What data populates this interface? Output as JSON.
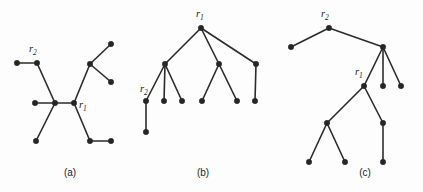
{
  "figure": {
    "background_color": "#fdfdfd",
    "node_color": "#262626",
    "edge_color": "#2b2b2b",
    "node_radius": 2.7,
    "edge_width": 1.6
  },
  "panels": [
    {
      "id": "panel-a",
      "caption": "(a)",
      "caption_pos": {
        "x": 70,
        "y": 176
      },
      "labels": [
        {
          "name": "r2",
          "base": "r",
          "sub": "2",
          "x": 29,
          "y": 52
        },
        {
          "name": "r1",
          "base": "r",
          "sub": "1",
          "x": 79,
          "y": 108
        }
      ],
      "nodes": [
        {
          "name": "a-leaf-left-upper",
          "x": 17,
          "y": 63
        },
        {
          "name": "a-r2",
          "x": 37,
          "y": 63
        },
        {
          "name": "a-leaf-left-mid",
          "x": 35,
          "y": 103
        },
        {
          "name": "a-center",
          "x": 55,
          "y": 103
        },
        {
          "name": "a-leaf-lower-left",
          "x": 36,
          "y": 141
        },
        {
          "name": "a-r1",
          "x": 74,
          "y": 103
        },
        {
          "name": "a-branch-upper",
          "x": 90,
          "y": 64
        },
        {
          "name": "a-leaf-top-right",
          "x": 111,
          "y": 44
        },
        {
          "name": "a-leaf-mid-right",
          "x": 111,
          "y": 82
        },
        {
          "name": "a-leaf-bottom-mid",
          "x": 90,
          "y": 141
        },
        {
          "name": "a-leaf-bottom-right",
          "x": 111,
          "y": 141
        }
      ],
      "edges": [
        {
          "from": "a-leaf-left-upper",
          "to": "a-r2"
        },
        {
          "from": "a-r2",
          "to": "a-center"
        },
        {
          "from": "a-leaf-left-mid",
          "to": "a-center"
        },
        {
          "from": "a-center",
          "to": "a-leaf-lower-left"
        },
        {
          "from": "a-center",
          "to": "a-r1"
        },
        {
          "from": "a-r1",
          "to": "a-branch-upper"
        },
        {
          "from": "a-branch-upper",
          "to": "a-leaf-top-right"
        },
        {
          "from": "a-branch-upper",
          "to": "a-leaf-mid-right"
        },
        {
          "from": "a-r1",
          "to": "a-leaf-bottom-mid"
        },
        {
          "from": "a-leaf-bottom-mid",
          "to": "a-leaf-bottom-right"
        }
      ]
    },
    {
      "id": "panel-b",
      "caption": "(b)",
      "caption_pos": {
        "x": 203,
        "y": 176
      },
      "labels": [
        {
          "name": "r1",
          "base": "r",
          "sub": "1",
          "x": 196,
          "y": 17
        },
        {
          "name": "r2",
          "base": "r",
          "sub": "2",
          "x": 140,
          "y": 92
        }
      ],
      "nodes": [
        {
          "name": "b-r1",
          "x": 201,
          "y": 28
        },
        {
          "name": "b-child-left",
          "x": 165,
          "y": 64
        },
        {
          "name": "b-child-mid",
          "x": 219,
          "y": 64
        },
        {
          "name": "b-child-right",
          "x": 256,
          "y": 64
        },
        {
          "name": "b-r2",
          "x": 146,
          "y": 101
        },
        {
          "name": "b-leaf-2",
          "x": 164,
          "y": 101
        },
        {
          "name": "b-leaf-3",
          "x": 182,
          "y": 101
        },
        {
          "name": "b-leaf-4",
          "x": 202,
          "y": 101
        },
        {
          "name": "b-leaf-5",
          "x": 237,
          "y": 101
        },
        {
          "name": "b-leaf-6",
          "x": 255,
          "y": 101
        },
        {
          "name": "b-r2-child",
          "x": 146,
          "y": 132
        }
      ],
      "edges": [
        {
          "from": "b-r1",
          "to": "b-child-left"
        },
        {
          "from": "b-r1",
          "to": "b-child-mid"
        },
        {
          "from": "b-r1",
          "to": "b-child-right"
        },
        {
          "from": "b-child-left",
          "to": "b-r2"
        },
        {
          "from": "b-child-left",
          "to": "b-leaf-2"
        },
        {
          "from": "b-child-left",
          "to": "b-leaf-3"
        },
        {
          "from": "b-child-mid",
          "to": "b-leaf-4"
        },
        {
          "from": "b-child-mid",
          "to": "b-leaf-5"
        },
        {
          "from": "b-child-right",
          "to": "b-leaf-6"
        },
        {
          "from": "b-r2",
          "to": "b-r2-child"
        }
      ]
    },
    {
      "id": "panel-c",
      "caption": "(c)",
      "caption_pos": {
        "x": 365,
        "y": 176
      },
      "labels": [
        {
          "name": "r2",
          "base": "r",
          "sub": "2",
          "x": 321,
          "y": 17
        },
        {
          "name": "r1",
          "base": "r",
          "sub": "1",
          "x": 355,
          "y": 75
        }
      ],
      "nodes": [
        {
          "name": "c-r2",
          "x": 329,
          "y": 28
        },
        {
          "name": "c-leaf-far-left",
          "x": 291,
          "y": 47
        },
        {
          "name": "c-hub",
          "x": 383,
          "y": 47
        },
        {
          "name": "c-hub-leaf-1",
          "x": 383,
          "y": 86
        },
        {
          "name": "c-hub-leaf-2",
          "x": 401,
          "y": 86
        },
        {
          "name": "c-r1",
          "x": 364,
          "y": 86
        },
        {
          "name": "c-mid-left",
          "x": 327,
          "y": 123
        },
        {
          "name": "c-leaf-bot-1",
          "x": 309,
          "y": 162
        },
        {
          "name": "c-leaf-bot-2",
          "x": 345,
          "y": 162
        },
        {
          "name": "c-right-mid",
          "x": 383,
          "y": 123
        },
        {
          "name": "c-leaf-bot-3",
          "x": 383,
          "y": 162
        }
      ],
      "edges": [
        {
          "from": "c-leaf-far-left",
          "to": "c-r2"
        },
        {
          "from": "c-r2",
          "to": "c-hub"
        },
        {
          "from": "c-hub",
          "to": "c-r1"
        },
        {
          "from": "c-hub",
          "to": "c-hub-leaf-1"
        },
        {
          "from": "c-hub",
          "to": "c-hub-leaf-2"
        },
        {
          "from": "c-r1",
          "to": "c-mid-left"
        },
        {
          "from": "c-mid-left",
          "to": "c-leaf-bot-1"
        },
        {
          "from": "c-mid-left",
          "to": "c-leaf-bot-2"
        },
        {
          "from": "c-r1",
          "to": "c-right-mid"
        },
        {
          "from": "c-right-mid",
          "to": "c-leaf-bot-3"
        }
      ]
    }
  ]
}
